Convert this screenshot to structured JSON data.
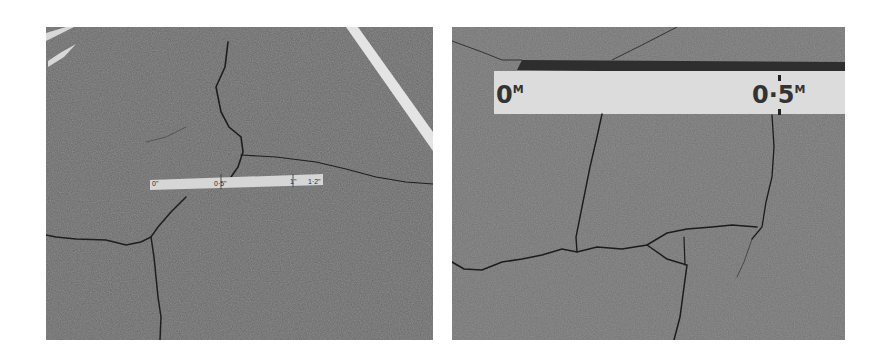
{
  "figure": {
    "panels": [
      {
        "id": "left",
        "description": "Asphalt pavement with longitudinal and transverse cracks and a ruler, white lane marking at top right",
        "ruler_labels": [
          "0\"",
          "0·5\"",
          "1\"",
          "1·2\""
        ]
      },
      {
        "id": "right",
        "description": "Close-up of asphalt pavement with block cracking and a metric ruler",
        "ruler_labels": [
          "0",
          "0·5"
        ],
        "ruler_unit": "M"
      }
    ],
    "colors": {
      "asphalt": "#6a6a6a",
      "crack": "#1e1e1e",
      "ruler": "#d8d8d8",
      "lane_marking": "#e6e6e6",
      "background": "#ffffff"
    }
  }
}
